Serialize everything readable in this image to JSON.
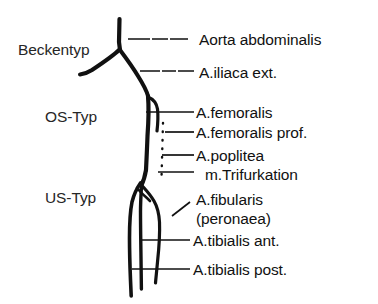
{
  "diagram": {
    "background_color": "#ffffff",
    "stroke_color": "#111111",
    "text_color": "#1a1a1a"
  },
  "type_labels": [
    {
      "id": "beckentyp",
      "text": "Beckentyp",
      "x": 18,
      "y": 42
    },
    {
      "id": "os-typ",
      "text": "OS-Typ",
      "x": 45,
      "y": 109
    },
    {
      "id": "us-typ",
      "text": "US-Typ",
      "x": 45,
      "y": 190
    }
  ],
  "annotations": [
    {
      "id": "aorta-abdominalis",
      "text": "Aorta abdominalis",
      "x": 199,
      "y": 32
    },
    {
      "id": "a-iliaca-ext",
      "text": "A.iliaca ext.",
      "x": 199,
      "y": 65
    },
    {
      "id": "a-femoralis",
      "text": "A.femoralis",
      "x": 196,
      "y": 105
    },
    {
      "id": "a-femoralis-prof",
      "text": "A.femoralis prof.",
      "x": 196,
      "y": 125
    },
    {
      "id": "a-poplitea",
      "text": "A.poplitea",
      "x": 196,
      "y": 148
    },
    {
      "id": "m-trifurkation",
      "text": "m.Trifurkation",
      "x": 205,
      "y": 167
    },
    {
      "id": "a-fibularis",
      "text": "A.fibularis",
      "x": 196,
      "y": 192
    },
    {
      "id": "a-peronaea",
      "text": "(peronaea)",
      "x": 196,
      "y": 211
    },
    {
      "id": "a-tibialis-ant",
      "text": "A.tibialis ant.",
      "x": 193,
      "y": 233
    },
    {
      "id": "a-tibialis-post",
      "text": "A.tibialis post.",
      "x": 193,
      "y": 262
    }
  ],
  "vessels": [
    {
      "id": "aorta-abdominalis-vessel",
      "label": "Aorta abdominalis"
    },
    {
      "id": "iliaca-left-vessel",
      "label": "A.iliaca (links)"
    },
    {
      "id": "iliaca-right-vessel",
      "label": "A.iliaca ext."
    },
    {
      "id": "femoralis-vessel",
      "label": "A.femoralis"
    },
    {
      "id": "femoralis-profunda-vessel",
      "label": "A.femoralis profunda"
    },
    {
      "id": "poplitea-vessel",
      "label": "A.poplitea"
    },
    {
      "id": "fibularis-vessel",
      "label": "A.fibularis"
    },
    {
      "id": "tibialis-anterior-vessel",
      "label": "A.tibialis anterior"
    },
    {
      "id": "tibialis-posterior-vessel",
      "label": "A.tibialis posterior"
    }
  ],
  "occlusion_marker": {
    "id": "occlusion-dotted-segment",
    "style": "dotted",
    "label": "Verschlussstrecke"
  }
}
